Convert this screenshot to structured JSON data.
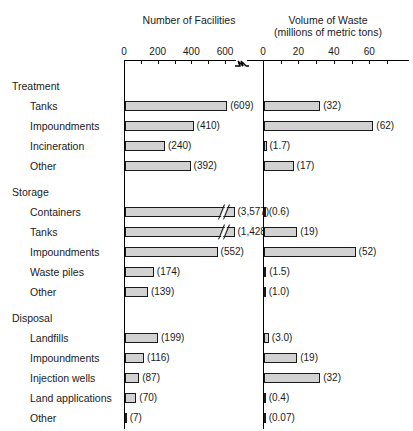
{
  "panels": {
    "left": {
      "title": "Number of Facilities",
      "subtitle": ""
    },
    "right": {
      "title": "Volume of Waste",
      "subtitle": "(millions of metric tons)"
    }
  },
  "chart_data": {
    "type": "bar",
    "orientation": "horizontal",
    "title": "",
    "panels": [
      {
        "name": "facilities",
        "xlabel": "Number of Facilities",
        "xlim": [
          0,
          700
        ],
        "ticks": [
          0,
          100,
          200,
          300,
          400,
          500,
          600,
          700
        ],
        "tick_labels": [
          "0",
          "",
          "200",
          "",
          "400",
          "",
          "600",
          ""
        ],
        "axis_break": true,
        "grid": false
      },
      {
        "name": "waste_volume",
        "xlabel": "Volume of Waste (millions of metric tons)",
        "xlim": [
          0,
          70
        ],
        "ticks": [
          0,
          10,
          20,
          30,
          40,
          50,
          60,
          70
        ],
        "tick_labels": [
          "0",
          "",
          "20",
          "",
          "40",
          "",
          "60",
          ""
        ],
        "axis_break": false,
        "grid": false
      }
    ],
    "groups": [
      {
        "label": "Treatment",
        "rows": [
          {
            "label": "Tanks",
            "facilities": 609,
            "facilities_text": "(609)",
            "waste": 32,
            "waste_text": "(32)"
          },
          {
            "label": "Impoundments",
            "facilities": 410,
            "facilities_text": "(410)",
            "waste": 62,
            "waste_text": "(62)"
          },
          {
            "label": "Incineration",
            "facilities": 240,
            "facilities_text": "(240)",
            "waste": 1.7,
            "waste_text": "(1.7)"
          },
          {
            "label": "Other",
            "facilities": 392,
            "facilities_text": "(392)",
            "waste": 17,
            "waste_text": "(17)"
          }
        ]
      },
      {
        "label": "Storage",
        "rows": [
          {
            "label": "Containers",
            "facilities": 3577,
            "facilities_text": "(3,577)",
            "facilities_clipped": true,
            "waste": 0.6,
            "waste_text": "(0.6)"
          },
          {
            "label": "Tanks",
            "facilities": 1428,
            "facilities_text": "(1,428)",
            "facilities_clipped": true,
            "waste": 19,
            "waste_text": "(19)"
          },
          {
            "label": "Impoundments",
            "facilities": 552,
            "facilities_text": "(552)",
            "waste": 52,
            "waste_text": "(52)"
          },
          {
            "label": "Waste piles",
            "facilities": 174,
            "facilities_text": "(174)",
            "waste": 1.5,
            "waste_text": "(1.5)"
          },
          {
            "label": "Other",
            "facilities": 139,
            "facilities_text": "(139)",
            "waste": 1.0,
            "waste_text": "(1.0)"
          }
        ]
      },
      {
        "label": "Disposal",
        "rows": [
          {
            "label": "Landfills",
            "facilities": 199,
            "facilities_text": "(199)",
            "waste": 3.0,
            "waste_text": "(3.0)"
          },
          {
            "label": "Impoundments",
            "facilities": 116,
            "facilities_text": "(116)",
            "waste": 19,
            "waste_text": "(19)"
          },
          {
            "label": "Injection wells",
            "facilities": 87,
            "facilities_text": "(87)",
            "waste": 32,
            "waste_text": "(32)"
          },
          {
            "label": "Land applications",
            "facilities": 70,
            "facilities_text": "(70)",
            "waste": 0.4,
            "waste_text": "(0.4)"
          },
          {
            "label": "Other",
            "facilities": 7,
            "facilities_text": "(7)",
            "waste": 0.07,
            "waste_text": "(0.07)"
          }
        ]
      }
    ],
    "colors": {
      "bar_fill": "#d2d2d2",
      "bar_stroke": "#1a1a1a",
      "text": "#1a1a1a"
    }
  }
}
